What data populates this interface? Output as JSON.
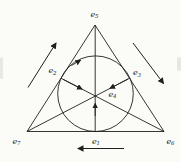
{
  "figure": {
    "labels": {
      "e5": {
        "base": "e",
        "sub": "5"
      },
      "e2": {
        "base": "e",
        "sub": "2"
      },
      "e3": {
        "base": "e",
        "sub": "3"
      },
      "e4": {
        "base": "e",
        "sub": "4"
      },
      "e7": {
        "base": "e",
        "sub": "7"
      },
      "e1": {
        "base": "e",
        "sub": "1"
      },
      "e6": {
        "base": "e",
        "sub": "6"
      }
    },
    "colors": {
      "stroke": "#1f1f1f",
      "background": "#fbfbf8"
    }
  }
}
